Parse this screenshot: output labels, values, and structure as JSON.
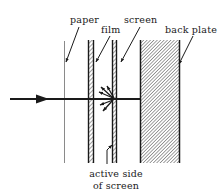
{
  "figure": {
    "background_color": "#ffffff",
    "ink_color": "#1a1a1a",
    "hatch_color": "#6e6e6e",
    "paper_line_color": "#8a8a8a",
    "width": 222,
    "height": 195,
    "labels": {
      "paper": "paper",
      "film": "film",
      "screen": "screen",
      "back_plate": "back plate",
      "active_side_line1": "active side",
      "active_side_line2": "of screen"
    },
    "components": [
      {
        "name": "paper",
        "label": "paper",
        "style": "thin-line",
        "x_left": 64,
        "x_right": 65,
        "y_top": 41,
        "y_bottom": 163
      },
      {
        "name": "film",
        "label": "film",
        "style": "hatched-bar",
        "x_left": 88,
        "x_right": 94,
        "y_top": 40,
        "y_bottom": 163
      },
      {
        "name": "screen",
        "label": "screen",
        "style": "hatched-bar",
        "x_left": 112,
        "x_right": 117,
        "y_top": 40,
        "y_bottom": 163
      },
      {
        "name": "back-plate",
        "label": "back plate",
        "style": "hatched-block",
        "x_left": 140,
        "x_right": 180,
        "y_top": 40,
        "y_bottom": 163
      }
    ],
    "incident_ray": {
      "name": "incident-ray",
      "x_start": 10,
      "x_end": 141,
      "y": 99,
      "arrowhead_x": 47
    },
    "emission_burst": {
      "name": "emission-burst",
      "origin_x": 114,
      "origin_y": 99,
      "arrow_count": 5,
      "direction": "leftward-fan"
    },
    "leaders": [
      {
        "name": "leader-paper",
        "x1": 79,
        "y1": 27,
        "x2": 66,
        "y2": 62
      },
      {
        "name": "leader-film",
        "x1": 110,
        "y1": 36,
        "x2": 95,
        "y2": 62
      },
      {
        "name": "leader-screen",
        "x1": 140,
        "y1": 27,
        "x2": 120,
        "y2": 62
      },
      {
        "name": "leader-back-plate",
        "x1": 193,
        "y1": 36,
        "x2": 178,
        "y2": 64
      },
      {
        "name": "leader-active-side",
        "x1": 107,
        "y1": 163,
        "x2": 113,
        "y2": 145
      }
    ],
    "label_positions": {
      "paper": {
        "x": 70,
        "y": 23
      },
      "film": {
        "x": 101,
        "y": 33
      },
      "screen": {
        "x": 124,
        "y": 23
      },
      "back_plate": {
        "x": 165,
        "y": 33
      },
      "active_side": {
        "x": 116,
        "y": 176
      },
      "of_screen": {
        "x": 116,
        "y": 188
      }
    }
  }
}
